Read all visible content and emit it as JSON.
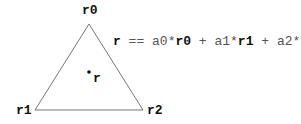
{
  "diagram": {
    "vertices": [
      {
        "id": "r0",
        "label": "r0",
        "x": 89,
        "y": 24
      },
      {
        "id": "r1",
        "label": "r1",
        "x": 35,
        "y": 110
      },
      {
        "id": "r2",
        "label": "r2",
        "x": 143,
        "y": 110
      }
    ],
    "point": {
      "label": "r",
      "x": 89,
      "y": 72
    },
    "formula": {
      "lhs": "r",
      "op": " == ",
      "terms": [
        {
          "coef": "a0*",
          "vec": "r0"
        },
        {
          "coef": "a1*",
          "vec": "r1"
        },
        {
          "coef": "a2*",
          "vec": "r2"
        }
      ],
      "plus": " + "
    }
  }
}
